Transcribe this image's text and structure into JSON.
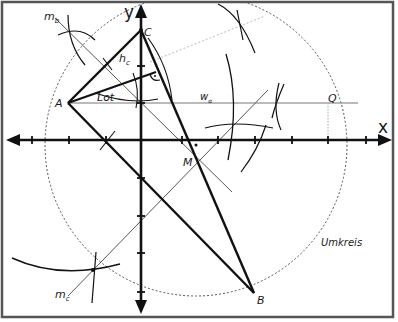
{
  "diagram": {
    "axes": {
      "x_label": "x",
      "y_label": "y"
    },
    "points": {
      "A": "A",
      "B": "B",
      "C": "C",
      "M": "M",
      "Q": "Q"
    },
    "lines": {
      "mb": "m",
      "mb_sub": "b",
      "mc": "m",
      "mc_sub": "c",
      "hc": "h",
      "hc_sub": "c",
      "lot": "Lot",
      "wa": "w",
      "wa_sub": "α"
    },
    "circle_label": "Umkreis",
    "colors": {
      "ink": "#111111",
      "thin_line": "#444444",
      "dotted": "#666666",
      "faint": "#bbbbbb",
      "frame": "#555555"
    }
  }
}
